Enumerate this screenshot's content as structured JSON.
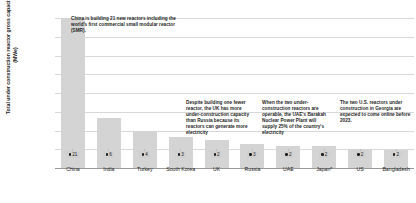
{
  "chart_data": {
    "type": "bar",
    "title": "",
    "xlabel": "",
    "ylabel": "Total under construction reactor gross capacity (MWe)",
    "ylim": [
      0,
      20000
    ],
    "grid": true,
    "legend": "none",
    "categories": [
      "China",
      "India",
      "Turkey",
      "South Korea",
      "UK",
      "Russia",
      "UAE",
      "Japan*",
      "US",
      "Bangladesh"
    ],
    "values": [
      20000,
      6700,
      5000,
      4200,
      3700,
      3200,
      3000,
      2900,
      2500,
      2400
    ],
    "ytick_labels": [
      "20k",
      "17.5k",
      "15k",
      "12.5k",
      "10k",
      "7.5k",
      "5k",
      "2.5k",
      "0"
    ],
    "ytick_values": [
      20000,
      17500,
      15000,
      12500,
      10000,
      7500,
      5000,
      2500,
      0
    ],
    "reactor_counts": [
      21,
      6,
      4,
      3,
      2,
      3,
      2,
      2,
      2,
      2
    ],
    "bar_color": "#d4d4d4",
    "badge_color": "#d0d0d0",
    "grid_color": "#d8d8d8",
    "annotations": [
      {
        "id": "china",
        "text": "China is building 21 new reactors including the world's first commercial small modular reactor (SMR)."
      },
      {
        "id": "uk",
        "text": "Despite building one fewer reactor, the UK has more under-construction capacity than Russia because its reactors can generate more electricity"
      },
      {
        "id": "uae",
        "text": "When the two under-construction reactors are operable, the UAE's Barakah Nuclear Power Plant will supply 25% of the country's electricity"
      },
      {
        "id": "us",
        "text": "The two U.S. reactors under construction in Georgia are expected to come online before 2023."
      }
    ]
  }
}
